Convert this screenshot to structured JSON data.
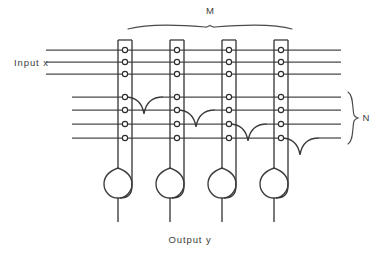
{
  "figure": {
    "labels": {
      "input": "Input  x",
      "output": "Output  y",
      "group_m": "M",
      "group_n": "N"
    },
    "colors": {
      "wire": "#4a4a4a",
      "column": "#3a3a3a",
      "node_fill": "#ffffff",
      "node_stroke": "#2e2e2e",
      "text": "#3c3c3c",
      "background": "#ffffff"
    },
    "geometry": {
      "width": 380,
      "height": 256,
      "row_y": [
        50,
        62,
        74,
        97,
        110,
        124,
        138
      ],
      "row_count": 7,
      "input_rows": [
        0,
        1,
        2
      ],
      "n_rows": [
        3,
        4,
        5,
        6
      ],
      "row_x_start_upper": 46,
      "row_x_start_lower": 72,
      "row_x_end": 341,
      "column_x": [
        118,
        170,
        222,
        274
      ],
      "column_count": 4,
      "column_width": 14,
      "column_top": 40,
      "column_bottom": 165,
      "bulb_radius": 14,
      "bulb_center_y": 182,
      "output_stem_bottom": 222,
      "dip_row_index": [
        3,
        4,
        5
      ],
      "dip_depth": 16,
      "brace_m": {
        "x1": 128,
        "x2": 292,
        "y": 25,
        "label_y": 14
      },
      "brace_n": {
        "y1": 92,
        "y2": 144,
        "x": 352,
        "label_x": 368
      }
    },
    "nodes_per_column": 7
  }
}
